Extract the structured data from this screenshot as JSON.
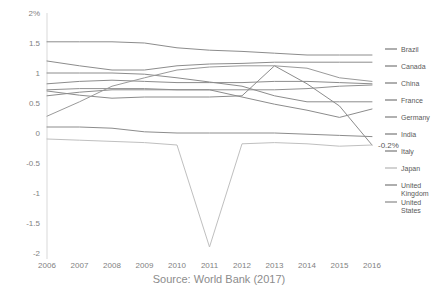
{
  "chart_data": {
    "type": "line",
    "title": "",
    "subtitle": "",
    "xlabel": "",
    "ylabel": "",
    "source": "Source: World Bank (2017)",
    "grid": false,
    "legend_position": "right",
    "categories": [
      "2006",
      "2007",
      "2008",
      "2009",
      "2010",
      "2011",
      "2012",
      "2013",
      "2014",
      "2015",
      "2016"
    ],
    "x": [
      2006,
      2007,
      2008,
      2009,
      2010,
      2011,
      2012,
      2013,
      2014,
      2015,
      2016
    ],
    "ylim": [
      -2,
      2
    ],
    "yticks": [
      "2%",
      "1.5",
      "1",
      "0.5",
      "0",
      "-0.5",
      "-1",
      "-1.5",
      "-2"
    ],
    "ytick_values": [
      2,
      1.5,
      1,
      0.5,
      0,
      -0.5,
      -1,
      -1.5,
      -2
    ],
    "annotations": [
      {
        "label": "-0.2%",
        "x": 2016,
        "y": -0.2
      }
    ],
    "series": [
      {
        "name": "Brazil",
        "color": "#8c8c8c",
        "values": [
          1.52,
          1.52,
          1.52,
          1.5,
          1.42,
          1.38,
          1.36,
          1.33,
          1.3,
          1.3,
          1.3
        ]
      },
      {
        "name": "Canada",
        "color": "#8c8c8c",
        "values": [
          1.2,
          1.12,
          1.05,
          1.05,
          1.12,
          1.15,
          1.16,
          1.18,
          1.18,
          1.18,
          1.18
        ]
      },
      {
        "name": "China",
        "color": "#8c8c8c",
        "values": [
          1.0,
          1.0,
          1.0,
          0.98,
          0.92,
          0.85,
          0.78,
          0.62,
          0.52,
          0.52,
          0.52
        ]
      },
      {
        "name": "France",
        "color": "#8c8c8c",
        "values": [
          0.82,
          0.86,
          0.88,
          0.86,
          0.84,
          0.84,
          0.84,
          0.86,
          0.86,
          0.84,
          0.82
        ]
      },
      {
        "name": "Germany",
        "color": "#909090",
        "values": [
          0.72,
          0.74,
          0.74,
          0.74,
          0.72,
          0.72,
          0.72,
          0.72,
          0.74,
          0.78,
          0.8
        ]
      },
      {
        "name": "India",
        "color": "#8c8c8c",
        "values": [
          0.7,
          0.63,
          0.58,
          0.6,
          0.6,
          0.6,
          0.62,
          1.12,
          0.82,
          0.45,
          -0.2
        ]
      },
      {
        "name": "Italy",
        "color": "#8c8c8c",
        "values": [
          0.62,
          0.68,
          0.72,
          0.72,
          0.72,
          0.72,
          0.6,
          0.48,
          0.38,
          0.26,
          0.4
        ]
      },
      {
        "name": "Japan",
        "color": "#bfbfbf",
        "values": [
          -0.1,
          -0.12,
          -0.14,
          -0.16,
          -0.2,
          -1.9,
          -0.18,
          -0.16,
          -0.18,
          -0.22,
          -0.2
        ]
      },
      {
        "name": "United Kingdom",
        "color": "#8c8c8c",
        "values": [
          0.1,
          0.1,
          0.08,
          0.02,
          0.0,
          0.0,
          0.0,
          0.0,
          -0.02,
          -0.04,
          -0.06
        ]
      },
      {
        "name": "United States",
        "color": "#9a9a9a",
        "values": [
          0.28,
          0.52,
          0.78,
          0.92,
          1.05,
          1.1,
          1.12,
          1.12,
          1.08,
          0.92,
          0.86
        ]
      }
    ]
  },
  "plot": {
    "left": 47,
    "right": 372,
    "top": 13,
    "bottom": 253
  },
  "legend": {
    "x_swatch": 385,
    "x_text": 401,
    "start_y": 49,
    "step": 17,
    "items": [
      {
        "label": "Brazil"
      },
      {
        "label": "Canada"
      },
      {
        "label": "China"
      },
      {
        "label": "France"
      },
      {
        "label": "Germany"
      },
      {
        "label": "India"
      },
      {
        "label": "Italy"
      },
      {
        "label": "Japan"
      },
      {
        "label": "United",
        "label2": "Kingdom"
      },
      {
        "label": "United",
        "label2": "States"
      }
    ]
  }
}
